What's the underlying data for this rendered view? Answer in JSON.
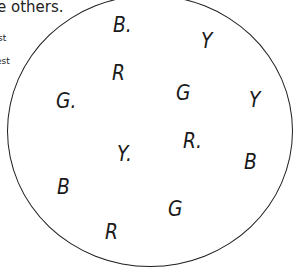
{
  "fragments": {
    "heading": "e others.",
    "line1": "st",
    "line2": "est"
  },
  "figure": {
    "shape": "circle",
    "letters": [
      {
        "text": "B.",
        "x": 113,
        "y": 14
      },
      {
        "text": "Y",
        "x": 201,
        "y": 30
      },
      {
        "text": "R",
        "x": 112,
        "y": 62
      },
      {
        "text": "G",
        "x": 176,
        "y": 82
      },
      {
        "text": "G.",
        "x": 56,
        "y": 90
      },
      {
        "text": "Y",
        "x": 249,
        "y": 89
      },
      {
        "text": "R.",
        "x": 183,
        "y": 130
      },
      {
        "text": "Y.",
        "x": 117,
        "y": 143
      },
      {
        "text": "B",
        "x": 244,
        "y": 151
      },
      {
        "text": "B",
        "x": 57,
        "y": 176
      },
      {
        "text": "G",
        "x": 168,
        "y": 198
      },
      {
        "text": "R",
        "x": 105,
        "y": 221
      }
    ]
  }
}
